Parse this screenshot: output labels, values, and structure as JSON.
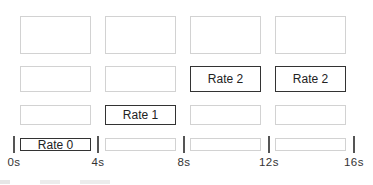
{
  "columns_x": [
    20,
    105,
    190,
    275
  ],
  "column_width": 71,
  "rows": [
    {
      "top": 16,
      "height": 38,
      "cells": [
        "",
        "",
        "",
        ""
      ],
      "active": [
        false,
        false,
        false,
        false
      ]
    },
    {
      "top": 66,
      "height": 26,
      "cells": [
        "",
        "",
        "Rate 2",
        "Rate 2"
      ],
      "active": [
        false,
        false,
        true,
        true
      ]
    },
    {
      "top": 105,
      "height": 20,
      "cells": [
        "",
        "Rate 1",
        "",
        ""
      ],
      "active": [
        false,
        true,
        false,
        false
      ]
    },
    {
      "top": 138,
      "height": 13,
      "cells": [
        "Rate 0",
        "",
        "",
        ""
      ],
      "active": [
        true,
        false,
        false,
        false
      ]
    }
  ],
  "timeline": {
    "ticks": [
      {
        "x": 13,
        "label": "0s"
      },
      {
        "x": 97,
        "label": "4s"
      },
      {
        "x": 183,
        "label": "8s"
      },
      {
        "x": 268,
        "label": "12s"
      },
      {
        "x": 353,
        "label": "16s"
      }
    ]
  },
  "colors": {
    "active_border": "#333333",
    "inactive_border": "#d2d2d2"
  }
}
